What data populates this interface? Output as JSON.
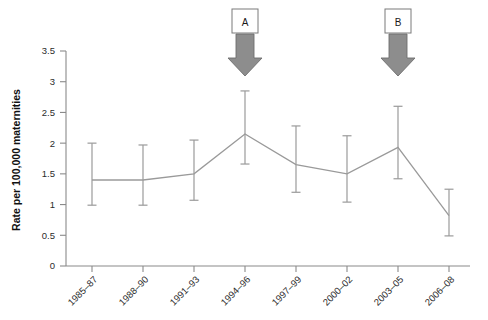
{
  "chart_data": {
    "type": "line",
    "title": "",
    "xlabel": "",
    "ylabel": "Rate per 100,000 maternities",
    "ylim": [
      0,
      3.5
    ],
    "ytick_labels": [
      "0",
      "0.5",
      "1",
      "1.5",
      "2",
      "2.5",
      "3",
      "3.5"
    ],
    "ytick_values": [
      0,
      0.5,
      1,
      1.5,
      2,
      2.5,
      3,
      3.5
    ],
    "grid": false,
    "legend": "none",
    "categories": [
      "1985–87",
      "1988–90",
      "1991–93",
      "1994–96",
      "1997–99",
      "2000–02",
      "2003–05",
      "2006–08"
    ],
    "values": [
      1.4,
      1.4,
      1.5,
      2.15,
      1.65,
      1.5,
      1.93,
      0.82
    ],
    "error_low": [
      0.99,
      0.99,
      1.07,
      1.66,
      1.2,
      1.04,
      1.42,
      0.49
    ],
    "error_high": [
      2.0,
      1.97,
      2.05,
      2.85,
      2.28,
      2.12,
      2.6,
      1.25
    ],
    "series": [
      {
        "name": "Rate per 100,000 maternities",
        "values": [
          1.4,
          1.4,
          1.5,
          2.15,
          1.65,
          1.5,
          1.93,
          0.82
        ]
      }
    ],
    "annotations": [
      {
        "label": "A",
        "category": "1994–96",
        "kind": "down-arrow"
      },
      {
        "label": "B",
        "category": "2003–05",
        "kind": "down-arrow"
      }
    ],
    "colors": {
      "line": "#9a9a9a",
      "errorbar": "#9a9a9a",
      "axis": "#8a8a8a",
      "arrow_fill": "#8d8d8d",
      "arrow_stroke": "#6e6e6e",
      "text": "#2b2b2b",
      "background": "#ffffff"
    }
  }
}
